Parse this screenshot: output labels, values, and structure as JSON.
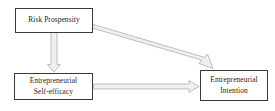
{
  "diagram": {
    "type": "conceptual-model",
    "background_color": "#ffffff",
    "box_border_color": "#3a3a3a",
    "arrow_fill_color": "#efefef",
    "arrow_outline_color": "#b4b4b4",
    "text_color": "#1d1d1d",
    "nodes": [
      {
        "id": "risk-propensity",
        "label": "Risk Prospensity",
        "position": "top-left"
      },
      {
        "id": "entrepreneurial-self-efficacy",
        "label": "Entrepreneurial\nSelf-efficacy",
        "position": "bottom-left"
      },
      {
        "id": "entrepreneurial-intention",
        "label": "Entrepreneurial\nIntention",
        "position": "right"
      }
    ],
    "arrows": [
      {
        "id": "risk-to-self-efficacy",
        "from": "risk-propensity",
        "to": "entrepreneurial-self-efficacy",
        "direction": "down",
        "style": "hollow-block-arrow"
      },
      {
        "id": "risk-to-intention",
        "from": "risk-propensity",
        "to": "entrepreneurial-intention",
        "direction": "down-right",
        "style": "hollow-block-arrow"
      },
      {
        "id": "self-efficacy-to-intention",
        "from": "entrepreneurial-self-efficacy",
        "to": "entrepreneurial-intention",
        "direction": "right",
        "style": "hollow-block-arrow"
      }
    ]
  }
}
